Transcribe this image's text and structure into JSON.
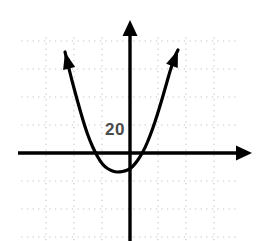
{
  "figure": {
    "background_color": "#ffffff",
    "width": 266,
    "height": 241
  },
  "labels": {
    "y_axis_value": "20"
  },
  "chart_data": {
    "type": "line",
    "title": "",
    "subtitle": "",
    "xlabel": "",
    "ylabel": "",
    "grid": true,
    "grid_style": "dotted",
    "legend": false,
    "axis_arrows": {
      "x_positive": true,
      "x_negative": false,
      "y_positive": true,
      "y_negative": false
    },
    "annotations": [
      {
        "text": "20",
        "position": "left of y-axis, above x-axis",
        "x_px": 116,
        "y_px": 128,
        "color": "#4a4a4a"
      }
    ],
    "curve": {
      "name": "parabola",
      "shape": "parabola",
      "opens": "up",
      "vertex_px": [
        120,
        172
      ],
      "x_intercepts_px": [
        88,
        148
      ],
      "end_arrows": [
        "left-branch-up",
        "right-branch-up"
      ],
      "stroke_color": "#000000",
      "points_px": [
        [
          65,
          52
        ],
        [
          70,
          73
        ],
        [
          75,
          92
        ],
        [
          80,
          110
        ],
        [
          85,
          127
        ],
        [
          90,
          141
        ],
        [
          95,
          152
        ],
        [
          100,
          161
        ],
        [
          105,
          167
        ],
        [
          110,
          170
        ],
        [
          115,
          172
        ],
        [
          120,
          172
        ],
        [
          125,
          171
        ],
        [
          130,
          169
        ],
        [
          135,
          164
        ],
        [
          140,
          157
        ],
        [
          145,
          148
        ],
        [
          150,
          136
        ],
        [
          155,
          122
        ],
        [
          160,
          106
        ],
        [
          165,
          89
        ],
        [
          170,
          71
        ],
        [
          175,
          56
        ],
        [
          178,
          50
        ]
      ]
    },
    "axes_px": {
      "x_axis_y": 153,
      "x_axis_x_start": 18,
      "x_axis_x_end": 252,
      "y_axis_x": 130,
      "y_axis_y_start": 20,
      "y_axis_y_end": 241
    },
    "grid_px": {
      "left": 22,
      "top": 38,
      "right": 240,
      "bottom": 241,
      "major_spacing": 28,
      "minor_spacing": 5.6
    }
  }
}
